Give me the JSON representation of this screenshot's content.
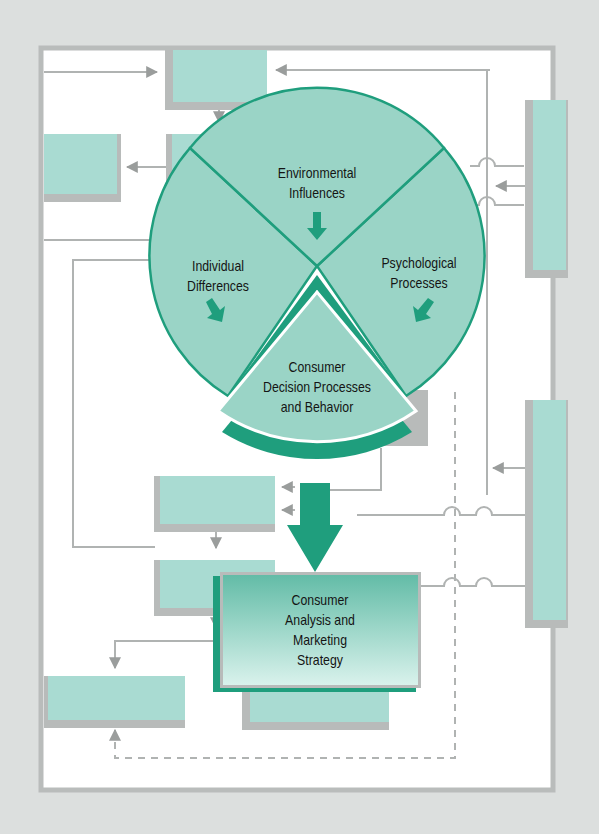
{
  "diagram": {
    "title": "",
    "colors": {
      "background": "#dcdfde",
      "frame_border": "#b9bcbb",
      "panel": "#ffffff",
      "box_fill": "#a9dbd2",
      "box_shadow": "#b8bbba",
      "accent_green": "#1f9e7d",
      "circle_fill": "#9ad4c6",
      "connector": "#b0b3b2",
      "text": "#141414"
    },
    "wheel": {
      "segments": [
        {
          "id": "environmental",
          "lines": [
            "Environmental",
            "Influences"
          ]
        },
        {
          "id": "individual",
          "lines": [
            "Individual",
            "Differences"
          ]
        },
        {
          "id": "psychological",
          "lines": [
            "Psychological",
            "Processes"
          ]
        }
      ],
      "center": {
        "id": "decision",
        "lines": [
          "Consumer",
          "Decision Processes",
          "and Behavior"
        ]
      }
    },
    "strategy_box": {
      "lines": [
        "Consumer",
        "Analysis and",
        "Marketing",
        "Strategy"
      ]
    },
    "blank_boxes": [
      "top-center",
      "left-upper",
      "under-top",
      "right-top-tall",
      "right-bottom-tall",
      "mid-left-1",
      "mid-left-2",
      "bottom-left",
      "bottom-center",
      "behind-wheel-right"
    ]
  }
}
